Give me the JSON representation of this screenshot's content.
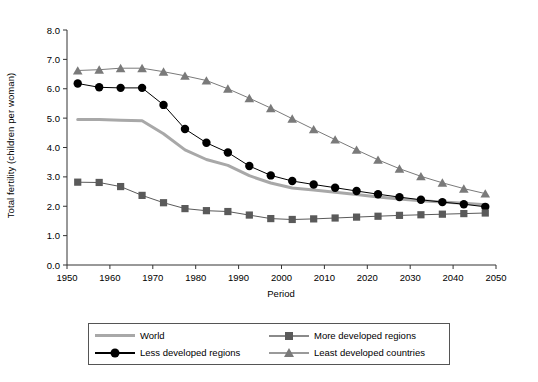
{
  "chart_data": {
    "type": "line",
    "title": "",
    "xlabel": "Period",
    "ylabel": "Total fertility (children per woman)",
    "xlim": [
      1950,
      2050
    ],
    "ylim": [
      0.0,
      8.0
    ],
    "xticks": [
      1950,
      1960,
      1970,
      1980,
      1990,
      2000,
      2010,
      2020,
      2030,
      2040,
      2050
    ],
    "yticks": [
      "0.0",
      "1.0",
      "2.0",
      "3.0",
      "4.0",
      "5.0",
      "6.0",
      "7.0",
      "8.0"
    ],
    "grid": false,
    "legend_position": "bottom",
    "x": [
      1952.5,
      1957.5,
      1962.5,
      1967.5,
      1972.5,
      1977.5,
      1982.5,
      1987.5,
      1992.5,
      1997.5,
      2002.5,
      2007.5,
      2012.5,
      2017.5,
      2022.5,
      2027.5,
      2032.5,
      2037.5,
      2042.5,
      2047.5
    ],
    "series": [
      {
        "name": "World",
        "marker": "none",
        "color": "#a8a8a8",
        "values": [
          4.95,
          4.95,
          4.93,
          4.91,
          4.47,
          3.92,
          3.59,
          3.39,
          3.04,
          2.79,
          2.62,
          2.55,
          2.48,
          2.4,
          2.32,
          2.25,
          2.19,
          2.14,
          2.1,
          2.05
        ]
      },
      {
        "name": "Less developed regions",
        "marker": "circle",
        "color": "#000000",
        "values": [
          6.18,
          6.05,
          6.03,
          6.03,
          5.45,
          4.63,
          4.16,
          3.83,
          3.37,
          3.05,
          2.86,
          2.74,
          2.63,
          2.52,
          2.41,
          2.31,
          2.22,
          2.14,
          2.07,
          1.98
        ]
      },
      {
        "name": "More developed regions",
        "marker": "square",
        "color": "#5a5a5a",
        "values": [
          2.82,
          2.81,
          2.67,
          2.37,
          2.12,
          1.92,
          1.85,
          1.82,
          1.7,
          1.58,
          1.55,
          1.57,
          1.6,
          1.63,
          1.66,
          1.69,
          1.71,
          1.73,
          1.75,
          1.77
        ]
      },
      {
        "name": "Least developed countries",
        "marker": "triangle",
        "color": "#7a7a7a",
        "values": [
          6.62,
          6.65,
          6.7,
          6.7,
          6.58,
          6.44,
          6.28,
          6.0,
          5.68,
          5.34,
          4.98,
          4.62,
          4.27,
          3.92,
          3.58,
          3.28,
          3.02,
          2.8,
          2.6,
          2.43
        ]
      }
    ]
  },
  "legend": {
    "items": [
      {
        "label": "World",
        "marker": "none"
      },
      {
        "label": "More developed regions",
        "marker": "square"
      },
      {
        "label": "Less developed regions",
        "marker": "circle"
      },
      {
        "label": "Least developed countries",
        "marker": "triangle"
      }
    ]
  },
  "colors": {
    "world": "#a8a8a8",
    "less_developed": "#000000",
    "more_developed": "#5a5a5a",
    "least_developed": "#7a7a7a",
    "axis": "#333333"
  }
}
